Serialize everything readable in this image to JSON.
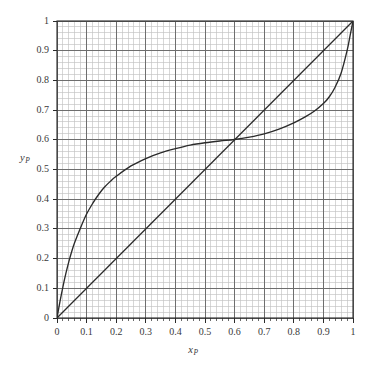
{
  "chart_data": {
    "type": "line",
    "title": "",
    "subtitle": "",
    "xlabel": "x_P",
    "ylabel": "y_P",
    "xlabel_base": "x",
    "xlabel_sub": "P",
    "ylabel_base": "y",
    "ylabel_sub": "P",
    "xlim": [
      0,
      1
    ],
    "ylim": [
      0,
      1
    ],
    "grid": true,
    "grid_major_step": 0.1,
    "grid_minor_step": 0.02,
    "legend": "none",
    "legend_position": "none",
    "annotations": [],
    "x_ticks": [
      0,
      0.1,
      0.2,
      0.3,
      0.4,
      0.5,
      0.6,
      0.7,
      0.8,
      0.9,
      1
    ],
    "y_ticks": [
      0,
      0.1,
      0.2,
      0.3,
      0.4,
      0.5,
      0.6,
      0.7,
      0.8,
      0.9,
      1
    ],
    "x_tick_labels": [
      "0",
      "0.1",
      "0.2",
      "0.3",
      "0.4",
      "0.5",
      "0.6",
      "0.7",
      "0.8",
      "0.9",
      "1"
    ],
    "y_tick_labels": [
      "0",
      "0.1",
      "0.2",
      "0.3",
      "0.4",
      "0.5",
      "0.6",
      "0.7",
      "0.8",
      "0.9",
      "1"
    ],
    "series": [
      {
        "name": "equilibrium-curve",
        "style": "solid",
        "color": "#2b2b2b",
        "x": [
          0,
          0.01,
          0.02,
          0.03,
          0.04,
          0.05,
          0.06,
          0.08,
          0.1,
          0.12,
          0.14,
          0.16,
          0.18,
          0.2,
          0.25,
          0.3,
          0.35,
          0.4,
          0.45,
          0.5,
          0.55,
          0.6,
          0.65,
          0.7,
          0.75,
          0.8,
          0.84,
          0.87,
          0.9,
          0.92,
          0.94,
          0.96,
          0.98,
          0.99,
          1
        ],
        "y": [
          0,
          0.055,
          0.105,
          0.15,
          0.19,
          0.225,
          0.255,
          0.305,
          0.35,
          0.385,
          0.415,
          0.44,
          0.46,
          0.477,
          0.512,
          0.537,
          0.556,
          0.57,
          0.582,
          0.59,
          0.596,
          0.601,
          0.609,
          0.62,
          0.636,
          0.657,
          0.678,
          0.697,
          0.722,
          0.745,
          0.778,
          0.825,
          0.9,
          0.95,
          1
        ]
      },
      {
        "name": "diagonal-45-degree-line",
        "style": "solid",
        "color": "#2b2b2b",
        "x": [
          0,
          1
        ],
        "y": [
          0,
          1
        ]
      }
    ],
    "azeotrope": {
      "x": 0.6,
      "y": 0.6
    }
  },
  "colors": {
    "background": "#ffffff",
    "axis": "#2b2b2b",
    "curve": "#2b2b2b",
    "grid_major": "#6e6e6e",
    "grid_minor": "#c2c2c2",
    "text": "#3a3a3a"
  },
  "geometry": {
    "plot_left": 57,
    "plot_top": 21,
    "plot_right": 353,
    "plot_bottom": 318
  }
}
